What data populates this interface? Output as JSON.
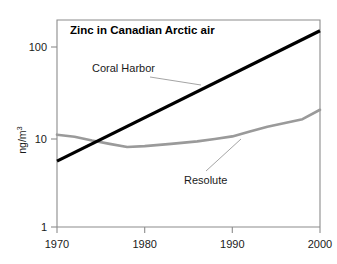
{
  "chart_data": {
    "type": "line",
    "title": "Zinc in Canadian Arctic air",
    "xlabel": "",
    "ylabel": "ng/m",
    "ylabel_superscript": "3",
    "yscale": "log",
    "xlim": [
      1970,
      2000
    ],
    "ylim": [
      1,
      300
    ],
    "grid": false,
    "legend_position": "inline-annotations",
    "xticks": [
      1970,
      1980,
      1990,
      2000
    ],
    "xtick_labels": [
      "1970",
      "1980",
      "1990",
      "2000"
    ],
    "yticks": [
      1,
      10,
      100
    ],
    "ytick_labels": [
      "1",
      "10",
      "100"
    ],
    "series": [
      {
        "name": "Coral Harbor",
        "color": "#000000",
        "width": 3.2,
        "x": [
          1970,
          2000
        ],
        "values": [
          5.6,
          170
        ]
      },
      {
        "name": "Resolute",
        "color": "#9a9a9a",
        "width": 2.6,
        "x": [
          1970,
          1972,
          1974,
          1976,
          1978,
          1980,
          1983,
          1986,
          1988,
          1990,
          1992,
          1994,
          1996,
          1998,
          2000
        ],
        "values": [
          11.2,
          10.6,
          9.6,
          8.8,
          8.1,
          8.3,
          8.8,
          9.4,
          10.0,
          10.7,
          12.2,
          13.8,
          15.2,
          16.8,
          21.5
        ]
      }
    ],
    "annotations": [
      {
        "name": "coral-harbor-annotation",
        "text": "Coral Harbor",
        "x_px": 92,
        "y_px": 72,
        "leader": [
          150,
          77,
          201,
          85
        ]
      },
      {
        "name": "resolute-annotation",
        "text": "Resolute",
        "x_px": 184,
        "y_px": 184,
        "leader": [
          206,
          171,
          241,
          139
        ]
      }
    ],
    "colors": {
      "coral_harbor": "#000000",
      "resolute": "#9a9a9a",
      "axis": "#808080",
      "text": "#1a1a1a",
      "background": "#ffffff"
    }
  }
}
